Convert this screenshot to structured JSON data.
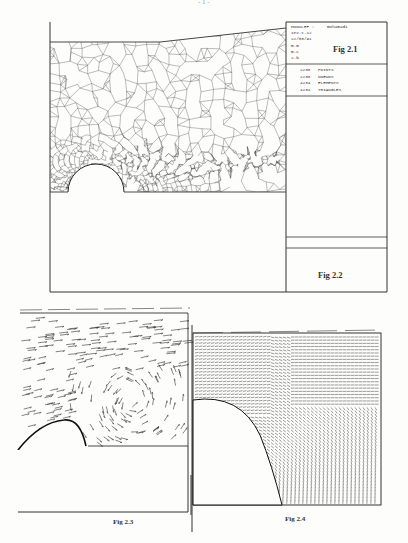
{
  "page": {
    "number": "- 1 -"
  },
  "fig2_1": {
    "info": {
      "program": "MODULEF :",
      "user": "mohamadi",
      "line2": "1ev-t-12",
      "date": "22/03/91",
      "line4": "m.m",
      "line5": "m.c",
      "line6": "2.b"
    },
    "label": "Fig 2.1",
    "stats": [
      {
        "count": "2238",
        "name": "POINTS"
      },
      {
        "count": "2238",
        "name": "NOEUDS"
      },
      {
        "count": "4234",
        "name": "ELEMENTS"
      },
      {
        "count": "4234",
        "name": "TRIANGLES"
      }
    ]
  },
  "fig2_2": {
    "label": "Fig 2.2"
  },
  "fig2_3": {
    "label": "Fig 2.3"
  },
  "fig2_4": {
    "label": "Fig 2.4"
  }
}
